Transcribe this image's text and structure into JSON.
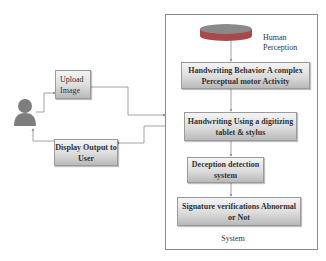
{
  "diagram": {
    "actor": {
      "icon": "person-icon",
      "color": "#7d7d7d"
    },
    "upload_box": {
      "label": "Upload Image"
    },
    "display_box": {
      "label": "Display Output to User"
    },
    "system": {
      "label": "System",
      "perception": {
        "label": "Human Perception",
        "icon": "database-cylinder-icon"
      },
      "steps": [
        {
          "label": "Handwriting Behavior A complex Perceptual motor Activity"
        },
        {
          "label": "Handwriting Using a digitizing tablet & stylus"
        },
        {
          "label": "Deception detection system"
        },
        {
          "label": "Signature verifications Abnormal or Not"
        }
      ]
    },
    "colors": {
      "line": "#8c8c8c",
      "border": "#9a9a9a",
      "cylinder_top": "#7a7a7a",
      "cylinder_body": "#a94a4a"
    }
  }
}
